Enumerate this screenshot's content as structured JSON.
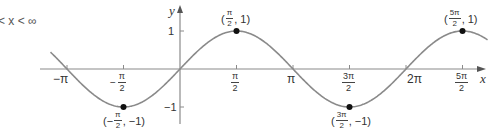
{
  "domain_label": "x-range caption",
  "caption": {
    "text": "< x < ∞"
  },
  "axes": {
    "x_label": "x",
    "y_label": "y",
    "y_ticks": [
      {
        "value": 1,
        "label": "1"
      },
      {
        "value": -1,
        "label": "−1"
      }
    ],
    "x_ticks": [
      {
        "value": "-pi",
        "label": "−π"
      },
      {
        "value": "-pi/2",
        "label_sign": "−",
        "num": "π",
        "den": "2"
      },
      {
        "value": "pi/2",
        "num": "π",
        "den": "2"
      },
      {
        "value": "pi",
        "label": "π"
      },
      {
        "value": "3pi/2",
        "num": "3π",
        "den": "2"
      },
      {
        "value": "2pi",
        "label": "2π"
      },
      {
        "value": "5pi/2",
        "num": "5π",
        "den": "2"
      }
    ]
  },
  "curve": {
    "function": "y = sin x",
    "color": "#8a8a8a"
  },
  "points": [
    {
      "name": "max-pi-over-2",
      "open": "(",
      "num": "π",
      "den": "2",
      "sep": ", 1)",
      "sign": ""
    },
    {
      "name": "max-5pi-over-2",
      "open": "(",
      "num": "5π",
      "den": "2",
      "sep": ", 1)",
      "sign": ""
    },
    {
      "name": "min-neg-pi-over-2",
      "open": "(−",
      "num": "π",
      "den": "2",
      "sep": ", −1)",
      "sign": "−"
    },
    {
      "name": "min-3pi-over-2",
      "open": "(",
      "num": "3π",
      "den": "2",
      "sep": ", −1)",
      "sign": ""
    }
  ],
  "chart_data": {
    "type": "line",
    "xlabel": "x",
    "ylabel": "y",
    "x_tick_labels": [
      "−π",
      "−π/2",
      "π/2",
      "π",
      "3π/2",
      "2π",
      "5π/2"
    ],
    "y_tick_labels": [
      "1",
      "−1"
    ],
    "ylim": [
      -1,
      1
    ],
    "xlim": [
      "−π−",
      "5π/2+"
    ],
    "grid": false,
    "series": [
      {
        "name": "sin x",
        "x": [
          -3.1416,
          -1.5708,
          0,
          1.5708,
          3.1416,
          4.7124,
          6.2832,
          7.854
        ],
        "values": [
          0,
          -1,
          0,
          1,
          0,
          -1,
          0,
          1
        ]
      }
    ],
    "annotations": [
      {
        "x": "π/2",
        "y": 1,
        "label": "(π/2, 1)"
      },
      {
        "x": "−π/2",
        "y": -1,
        "label": "(−π/2, −1)"
      },
      {
        "x": "3π/2",
        "y": -1,
        "label": "(3π/2, −1)"
      },
      {
        "x": "5π/2",
        "y": 1,
        "label": "(5π/2, 1)"
      }
    ]
  }
}
